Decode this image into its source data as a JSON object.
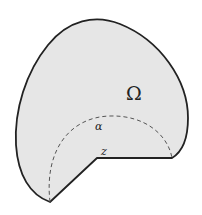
{
  "diagram": {
    "region_label": "Ω",
    "arc_label": "α",
    "point_label": "z",
    "colors": {
      "fill": "#e6e6e6",
      "stroke": "#222222",
      "background": "#ffffff"
    }
  }
}
